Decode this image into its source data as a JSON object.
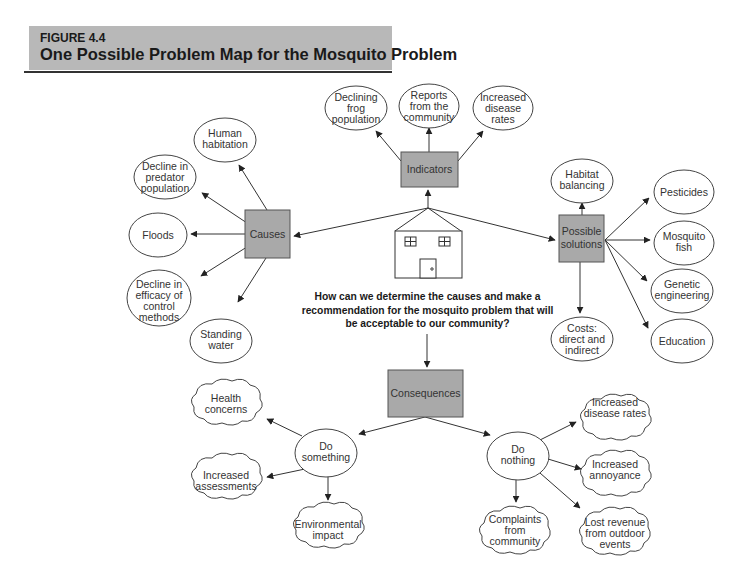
{
  "header": {
    "figure_label": "FIGURE 4.4",
    "title": "One Possible Problem Map for the Mosquito Problem"
  },
  "central_question": "How can we determine the causes and make a recommendation for the mosquito problem that will be acceptable to our community?",
  "hub": {
    "icon": "house-icon"
  },
  "colors": {
    "box_fill": "#a9a9a9",
    "header_fill": "#b8b8b8",
    "line": "#333333"
  },
  "nodes": {
    "indicators": {
      "label": "Indicators",
      "children": [
        {
          "lines": [
            "Declining",
            "frog",
            "population"
          ]
        },
        {
          "lines": [
            "Reports",
            "from the",
            "community"
          ]
        },
        {
          "lines": [
            "Increased",
            "disease",
            "rates"
          ]
        }
      ]
    },
    "causes": {
      "label": "Causes",
      "children": [
        {
          "lines": [
            "Human",
            "habitation"
          ]
        },
        {
          "lines": [
            "Decline in",
            "predator",
            "population"
          ]
        },
        {
          "lines": [
            "Floods"
          ]
        },
        {
          "lines": [
            "Decline in",
            "efficacy of",
            "control",
            "methods"
          ]
        },
        {
          "lines": [
            "Standing",
            "water"
          ]
        }
      ]
    },
    "solutions": {
      "label_lines": [
        "Possible",
        "solutions"
      ],
      "children": [
        {
          "lines": [
            "Habitat",
            "balancing"
          ]
        },
        {
          "lines": [
            "Pesticides"
          ]
        },
        {
          "lines": [
            "Mosquito",
            "fish"
          ]
        },
        {
          "lines": [
            "Genetic",
            "engineering"
          ]
        },
        {
          "lines": [
            "Education"
          ]
        },
        {
          "lines": [
            "Costs:",
            "direct and",
            "indirect"
          ]
        }
      ]
    },
    "consequences": {
      "label": "Consequences",
      "do_something": {
        "lines": [
          "Do",
          "something"
        ],
        "children": [
          {
            "lines": [
              "Health",
              "concerns"
            ]
          },
          {
            "lines": [
              "Increased",
              "assessments"
            ]
          },
          {
            "lines": [
              "Environmental",
              "impact"
            ]
          }
        ]
      },
      "do_nothing": {
        "lines": [
          "Do",
          "nothing"
        ],
        "children": [
          {
            "lines": [
              "Increased",
              "disease rates"
            ]
          },
          {
            "lines": [
              "Increased",
              "annoyance"
            ]
          },
          {
            "lines": [
              "Complaints",
              "from",
              "community"
            ]
          },
          {
            "lines": [
              "Lost revenue",
              "from outdoor",
              "events"
            ]
          }
        ]
      }
    }
  }
}
